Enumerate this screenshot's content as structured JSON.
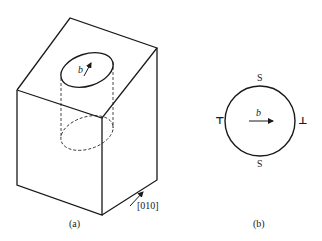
{
  "panel_a": {
    "caption": "(a)",
    "burgers_label": "b",
    "direction_label": "[010]"
  },
  "panel_b": {
    "caption": "(b)",
    "burgers_label": "b",
    "top_label": "S",
    "bottom_label": "S",
    "left_symbol": "⊤",
    "right_symbol": "⊥"
  },
  "colors": {
    "line": "#1a1a1a",
    "background": "#ffffff"
  }
}
